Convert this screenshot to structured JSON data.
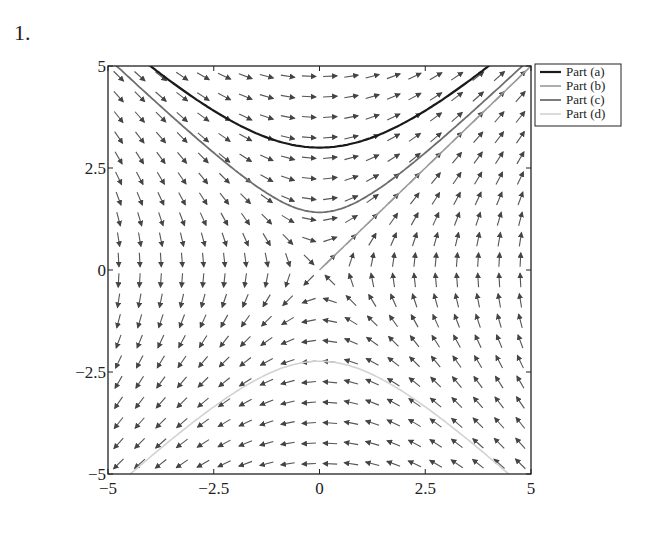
{
  "problem_number": "1.",
  "chart_data": {
    "type": "line",
    "subtype": "direction field with solution curves",
    "title": "",
    "xlabel": "",
    "ylabel": "",
    "xlim": [
      -5,
      5
    ],
    "ylim": [
      -5,
      5
    ],
    "xticks": [
      -5,
      -2.5,
      0,
      2.5,
      5
    ],
    "yticks": [
      -5,
      -2.5,
      0,
      2.5,
      5
    ],
    "xtick_labels": [
      "−5",
      "−2.5",
      "0",
      "2.5",
      "5"
    ],
    "ytick_labels": [
      "−5",
      "−2.5",
      "0",
      "2.5",
      "5"
    ],
    "grid": false,
    "field": {
      "equation": "dy/dx = x/y",
      "grid_n": 20,
      "arrow_color": "#555555"
    },
    "legend": {
      "position": "outside upper right",
      "entries": [
        "Part (a)",
        "Part (b)",
        "Part (c)",
        "Part (d)"
      ]
    },
    "series": [
      {
        "name": "Part (a)",
        "color": "#1a1a1a",
        "width": 2.2,
        "equation": "y = sqrt(x^2 + 9)",
        "x": [
          -4,
          -3,
          -2,
          -1,
          0,
          1,
          2,
          3,
          4
        ],
        "y": [
          5,
          4.24,
          3.61,
          3.16,
          3,
          3.16,
          3.61,
          4.24,
          5
        ]
      },
      {
        "name": "Part (b)",
        "color": "#9a9a9a",
        "width": 1.6,
        "equation": "y = x, x > 0",
        "x": [
          0,
          5
        ],
        "y": [
          0,
          5
        ]
      },
      {
        "name": "Part (c)",
        "color": "#6e6e6e",
        "width": 1.8,
        "equation": "y = sqrt(x^2 + 2)",
        "x": [
          -4.8,
          -3,
          -2,
          -1,
          0,
          1,
          2,
          3,
          4.8
        ],
        "y": [
          5,
          3.32,
          2.45,
          1.73,
          1.41,
          1.73,
          2.45,
          3.32,
          5
        ]
      },
      {
        "name": "Part (d)",
        "color": "#d2d2d2",
        "width": 1.6,
        "equation": "y = -sqrt(x^2 + 5)",
        "x": [
          -4.47,
          -3,
          -2,
          -1,
          0,
          1,
          2,
          3,
          4.47
        ],
        "y": [
          -5,
          -3.74,
          -3,
          -2.45,
          -2.24,
          -2.45,
          -3,
          -3.74,
          -5
        ]
      }
    ]
  }
}
